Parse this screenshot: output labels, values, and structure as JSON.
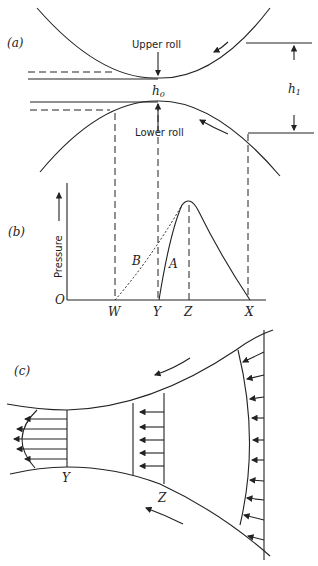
{
  "panel_a": {
    "label": "(a)",
    "upper_roll": "Upper roll",
    "lower_roll": "Lower roll",
    "h0": "h",
    "h0_sub": "0",
    "h1": "h",
    "h1_sub": "1"
  },
  "panel_b": {
    "label": "(b)",
    "ylabel": "Pressure",
    "origin": "O",
    "ticks": [
      "W",
      "Y",
      "Z",
      "X"
    ],
    "curve_a": "A",
    "curve_b": "B"
  },
  "panel_c": {
    "label": "(c)",
    "ticks": [
      "Y",
      "Z"
    ]
  }
}
